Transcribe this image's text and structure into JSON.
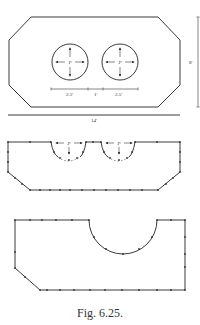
{
  "figure": {
    "caption": "Fig. 6.25.",
    "top_diagram": {
      "shape": "octagon",
      "width_label": "14'",
      "height_label": "8'",
      "spacing_labels": [
        "2.5'",
        "1'",
        "2.5'"
      ],
      "pressure_labels": [
        "P",
        "P"
      ]
    },
    "middle_diagram": {
      "shape": "octagon with two semicircular notches",
      "pressure_labels": [
        "P",
        "P"
      ]
    },
    "bottom_diagram": {
      "shape": "polygon with one semicircular cutout"
    }
  }
}
